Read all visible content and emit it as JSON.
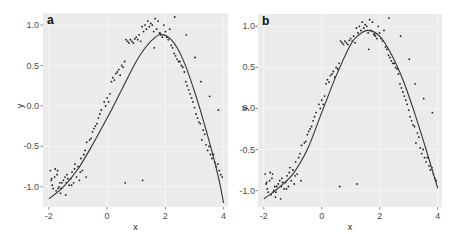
{
  "chart_data": [
    {
      "panel": "a",
      "type": "scatter",
      "title": "a",
      "xlabel": "x",
      "ylabel": "y",
      "xlim": [
        -2.2,
        4.15
      ],
      "ylim": [
        -1.25,
        1.15
      ],
      "xticks": [
        -2,
        0,
        2,
        4
      ],
      "xtick_labels": [
        "-2",
        "0",
        "2",
        "4"
      ],
      "yticks": [
        -1.0,
        -0.5,
        0.0,
        0.5,
        1.0
      ],
      "ytick_labels": [
        "-1.0",
        "-0.5",
        "0.0",
        "0.5",
        "1.0"
      ],
      "grid": true,
      "legend": "none",
      "series": [
        {
          "name": "observed",
          "kind": "points",
          "ref": "points"
        },
        {
          "name": "fit",
          "kind": "line",
          "x": [
            -2.0,
            -1.5,
            -1.0,
            -0.5,
            0.0,
            0.5,
            1.0,
            1.4,
            1.8,
            2.2,
            2.6,
            3.0,
            3.4,
            3.8,
            4.0
          ],
          "y": [
            -1.15,
            -1.0,
            -0.78,
            -0.48,
            -0.15,
            0.2,
            0.55,
            0.76,
            0.88,
            0.82,
            0.58,
            0.18,
            -0.3,
            -0.85,
            -1.2
          ]
        }
      ]
    },
    {
      "panel": "b",
      "type": "scatter",
      "title": "b",
      "xlabel": "x",
      "ylabel": "y",
      "xlim": [
        -2.2,
        4.15
      ],
      "ylim": [
        -1.2,
        1.15
      ],
      "xticks": [
        -2,
        0,
        2,
        4
      ],
      "xtick_labels": [
        "-2",
        "0",
        "2",
        "4"
      ],
      "yticks": [
        -1.0,
        -0.5,
        0.0,
        0.5,
        1.0
      ],
      "ytick_labels": [
        "-1.0",
        "-0.5",
        "0.0",
        "0.5",
        "1.0"
      ],
      "grid": true,
      "legend": "none",
      "series": [
        {
          "name": "observed",
          "kind": "points",
          "ref": "points"
        },
        {
          "name": "fit",
          "kind": "line",
          "x": [
            -2.0,
            -1.5,
            -1.0,
            -0.5,
            0.0,
            0.5,
            1.0,
            1.3,
            1.6,
            2.0,
            2.4,
            2.8,
            3.2,
            3.6,
            4.0
          ],
          "y": [
            -1.1,
            -0.97,
            -0.8,
            -0.5,
            -0.05,
            0.4,
            0.78,
            0.9,
            0.95,
            0.88,
            0.66,
            0.35,
            -0.05,
            -0.5,
            -0.97
          ]
        }
      ]
    }
  ],
  "points": {
    "x": [
      -1.95,
      -1.9,
      -1.88,
      -1.85,
      -1.8,
      -1.78,
      -1.75,
      -1.7,
      -1.68,
      -1.65,
      -1.6,
      -1.58,
      -1.55,
      -1.5,
      -1.45,
      -1.4,
      -1.38,
      -1.35,
      -1.3,
      -1.25,
      -1.2,
      -1.15,
      -1.1,
      -1.05,
      -1.0,
      -0.95,
      -0.9,
      -0.85,
      -0.8,
      -0.75,
      -0.7,
      -0.6,
      -0.55,
      -0.5,
      -0.45,
      -0.4,
      -0.35,
      -0.3,
      -0.25,
      -0.2,
      -0.1,
      -0.05,
      0.0,
      0.05,
      0.1,
      0.15,
      0.2,
      0.25,
      0.3,
      0.35,
      0.4,
      0.45,
      0.5,
      0.55,
      0.6,
      0.65,
      0.7,
      0.75,
      0.8,
      0.85,
      0.9,
      0.95,
      1.0,
      1.05,
      1.1,
      1.15,
      1.2,
      1.25,
      1.3,
      1.35,
      1.4,
      1.45,
      1.5,
      1.55,
      1.6,
      1.65,
      1.7,
      1.75,
      1.8,
      1.85,
      1.9,
      1.95,
      2.0,
      2.05,
      2.1,
      2.15,
      2.2,
      2.25,
      2.3,
      2.35,
      2.4,
      2.45,
      2.5,
      2.55,
      2.6,
      2.65,
      2.7,
      2.75,
      2.8,
      2.85,
      2.9,
      2.95,
      3.0,
      3.05,
      3.1,
      3.15,
      3.2,
      3.25,
      3.3,
      3.35,
      3.4,
      3.45,
      3.5,
      3.55,
      3.6,
      3.65,
      3.7,
      3.75,
      3.8,
      3.85,
      3.9,
      3.95,
      -1.92,
      -1.72,
      -1.62,
      -1.42,
      -1.22,
      -1.12,
      -0.92,
      -0.72,
      0.62,
      1.22,
      1.62,
      1.82,
      2.32,
      2.72,
      3.02,
      3.22,
      3.52,
      3.82
    ],
    "y": [
      -0.8,
      -0.9,
      -0.98,
      -1.02,
      -0.88,
      -0.78,
      -1.05,
      -0.8,
      -1.02,
      -1.0,
      -1.08,
      -1.02,
      -0.95,
      -0.92,
      -0.88,
      -0.95,
      -0.85,
      -0.9,
      -0.98,
      -0.9,
      -0.82,
      -0.95,
      -0.72,
      -0.88,
      -0.75,
      -0.92,
      -0.65,
      -0.8,
      -0.6,
      -0.55,
      -0.45,
      -0.42,
      -0.4,
      -0.32,
      -0.28,
      -0.25,
      -0.22,
      -0.15,
      -0.1,
      -0.05,
      0.05,
      0.0,
      0.1,
      0.05,
      0.15,
      0.3,
      0.35,
      0.32,
      0.4,
      0.42,
      0.45,
      0.38,
      0.5,
      0.48,
      0.55,
      0.82,
      0.8,
      0.78,
      0.82,
      0.8,
      0.78,
      0.83,
      0.85,
      0.82,
      0.88,
      0.8,
      0.98,
      0.92,
      1.0,
      0.95,
      1.05,
      0.98,
      1.02,
      1.0,
      0.92,
      1.08,
      0.95,
      1.05,
      0.9,
      0.88,
      0.85,
      1.0,
      0.92,
      0.85,
      0.82,
      0.95,
      0.75,
      0.72,
      0.65,
      0.62,
      0.58,
      0.55,
      0.55,
      0.5,
      0.48,
      0.42,
      0.3,
      0.25,
      0.2,
      0.15,
      0.1,
      0.05,
      -0.02,
      -0.1,
      -0.15,
      -0.2,
      -0.22,
      -0.42,
      -0.3,
      -0.35,
      -0.48,
      -0.55,
      -0.5,
      -0.6,
      -0.65,
      -0.6,
      -0.7,
      -0.75,
      -0.72,
      -0.8,
      -0.85,
      -0.88,
      -0.92,
      -0.85,
      -0.95,
      -1.1,
      -0.98,
      -0.78,
      -0.82,
      -0.88,
      -0.95,
      -0.92,
      0.72,
      0.9,
      1.1,
      0.88,
      0.6,
      0.3,
      0.12,
      -0.05,
      -0.58,
      -0.72
    ]
  },
  "panels": {
    "a": {
      "label": "a",
      "xlabel": "x",
      "ylabel": "y"
    },
    "b": {
      "label": "b",
      "xlabel": "x",
      "ylabel": "y"
    }
  },
  "colors": {
    "panel_bg": "#ebebeb",
    "grid": "#f7f7f7",
    "point": "#1a1a1a",
    "line": "#333333"
  }
}
